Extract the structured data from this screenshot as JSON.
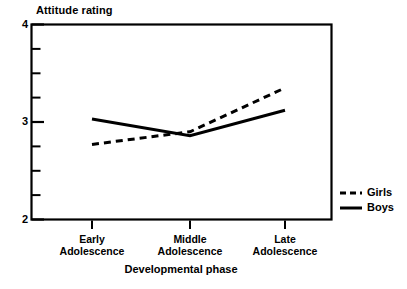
{
  "chart_data": {
    "type": "line",
    "title": "",
    "ylabel": "Attitude rating",
    "xlabel": "Developmental phase",
    "categories": [
      "Early Adolescence",
      "Middle Adolescence",
      "Late Adolescence"
    ],
    "category_lines": [
      [
        "Early",
        "Adolescence"
      ],
      [
        "Middle",
        "Adolescence"
      ],
      [
        "Late",
        "Adolescence"
      ]
    ],
    "ylim": [
      2,
      4
    ],
    "xlim_note": "categorical, 3 positions",
    "y_major_ticks": [
      2,
      3,
      4
    ],
    "y_major_tick_labels": [
      "2",
      "3",
      "4"
    ],
    "y_minor_ticks": [
      2.25,
      2.5,
      2.75,
      3.25,
      3.5,
      3.75
    ],
    "grid": false,
    "legend_position": "right-outside",
    "series": [
      {
        "name": "Girls",
        "style": "dashed",
        "color": "#000000",
        "values": [
          2.77,
          2.9,
          3.35
        ]
      },
      {
        "name": "Boys",
        "style": "solid",
        "color": "#000000",
        "values": [
          3.03,
          2.86,
          3.12
        ]
      }
    ]
  },
  "axes": {
    "y_title": "Attitude rating",
    "x_title": "Developmental phase",
    "y_labels": {
      "top": "4",
      "middle": "3",
      "bottom": "2"
    },
    "x_labels": [
      {
        "line1": "Early",
        "line2": "Adolescence"
      },
      {
        "line1": "Middle",
        "line2": "Adolescence"
      },
      {
        "line1": "Late",
        "line2": "Adolescence"
      }
    ]
  },
  "legend": {
    "items": [
      {
        "label": "Girls",
        "style": "dashed"
      },
      {
        "label": "Boys",
        "style": "solid"
      }
    ]
  },
  "colors": {
    "ink": "#000000",
    "background": "#ffffff"
  }
}
